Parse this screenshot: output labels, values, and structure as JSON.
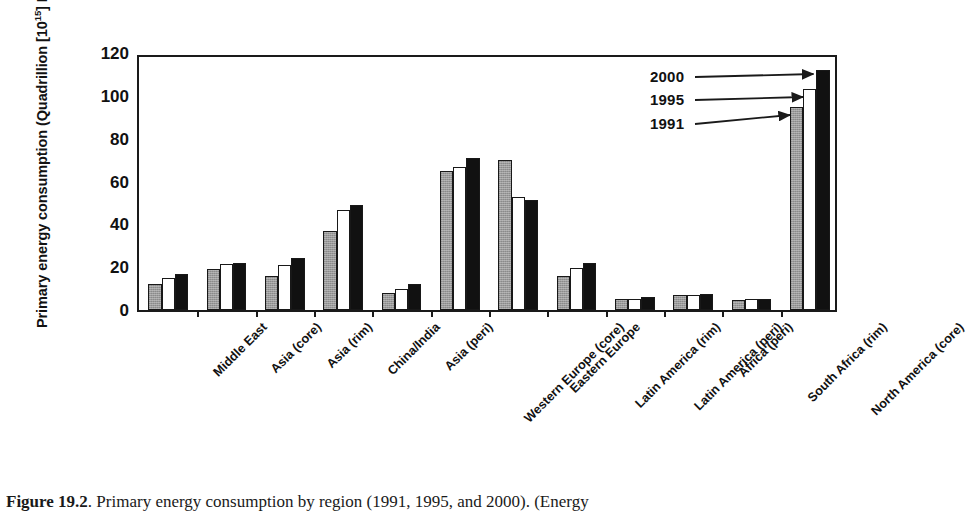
{
  "chart_data": {
    "type": "bar",
    "title": "",
    "xlabel": "",
    "ylabel": "Primary energy consumption (Quadrillion [10^15] BTU)",
    "ylim": [
      0,
      120
    ],
    "yticks": [
      0,
      20,
      40,
      60,
      80,
      100,
      120
    ],
    "grid": false,
    "legend_position": "inline-annotations",
    "categories": [
      "Middle East",
      "Asia (core)",
      "Asia (rim)",
      "China/India",
      "Asia (peri)",
      "Western Europe (core)",
      "Eastern Europe",
      "Latin America (rim)",
      "Latin America (peri)",
      "Africa (peri)",
      "South Africa (rim)",
      "North America (core)"
    ],
    "series": [
      {
        "name": "1991",
        "color": "#9a9a9a",
        "values": [
          12,
          19,
          16,
          37,
          8,
          65,
          70,
          16,
          5,
          7,
          4.5,
          95
        ]
      },
      {
        "name": "1995",
        "color": "#ffffff",
        "values": [
          15,
          21.5,
          21,
          46.5,
          10,
          67,
          53,
          19.5,
          5,
          7,
          5,
          103
        ]
      },
      {
        "name": "2000",
        "color": "#111111",
        "values": [
          17,
          22,
          24.5,
          49,
          12,
          71,
          51.5,
          22,
          6,
          7.5,
          5,
          112
        ]
      }
    ],
    "annotations": [
      {
        "text": "2000",
        "target_series": "2000",
        "target_category": "North America (core)"
      },
      {
        "text": "1995",
        "target_series": "1995",
        "target_category": "North America (core)"
      },
      {
        "text": "1991",
        "target_series": "1991",
        "target_category": "North America (core)"
      }
    ]
  },
  "axis": {
    "y_title_main": "Primary energy consumption (Quadrillion [10",
    "y_title_sup": "15",
    "y_title_tail": "] BTU)"
  },
  "caption": {
    "figure_number": "Figure 19.2",
    "text": ". Primary energy consumption by region (1991, 1995, and 2000). (Energy"
  }
}
